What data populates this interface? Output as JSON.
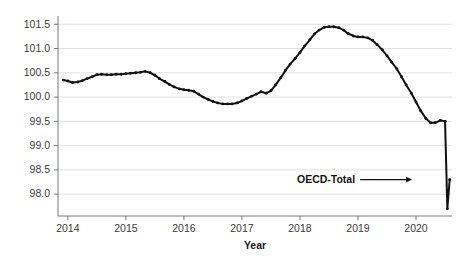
{
  "chart_data": {
    "type": "line",
    "title": "",
    "subtitle": "",
    "xlabel": "Year",
    "ylabel": "",
    "ylim": [
      97.55,
      101.65
    ],
    "xlim": [
      2013.83,
      2020.62
    ],
    "grid": true,
    "gridlines_horizontal": true,
    "gridlines_vertical": false,
    "legend_position": "inline-annotation",
    "y_ticks": [
      98.0,
      98.5,
      99.0,
      99.5,
      100.0,
      100.5,
      101.0,
      101.5
    ],
    "y_tick_labels": [
      "98.0",
      "98.5",
      "99.0",
      "99.5",
      "100.0",
      "100.5",
      "101.0",
      "101.5"
    ],
    "x_ticks": [
      2014,
      2015,
      2016,
      2017,
      2018,
      2019,
      2020
    ],
    "x_tick_labels": [
      "2014",
      "2015",
      "2016",
      "2017",
      "2018",
      "2019",
      "2020"
    ],
    "annotations": [
      {
        "text": "OECD-Total",
        "x": 2019.95,
        "y": 98.3,
        "leader": true,
        "arrow": true
      }
    ],
    "series": [
      {
        "name": "OECD-Total",
        "color": "#111111",
        "marker": "dot",
        "x": [
          2013.92,
          2014.0,
          2014.08,
          2014.17,
          2014.25,
          2014.33,
          2014.42,
          2014.5,
          2014.58,
          2014.67,
          2014.75,
          2014.83,
          2014.92,
          2015.0,
          2015.08,
          2015.17,
          2015.25,
          2015.33,
          2015.42,
          2015.5,
          2015.58,
          2015.67,
          2015.75,
          2015.83,
          2015.92,
          2016.0,
          2016.08,
          2016.17,
          2016.25,
          2016.33,
          2016.42,
          2016.5,
          2016.58,
          2016.67,
          2016.75,
          2016.83,
          2016.92,
          2017.0,
          2017.08,
          2017.17,
          2017.25,
          2017.33,
          2017.42,
          2017.5,
          2017.58,
          2017.67,
          2017.75,
          2017.83,
          2017.92,
          2018.0,
          2018.08,
          2018.17,
          2018.25,
          2018.33,
          2018.42,
          2018.5,
          2018.58,
          2018.67,
          2018.75,
          2018.83,
          2018.92,
          2019.0,
          2019.08,
          2019.17,
          2019.25,
          2019.33,
          2019.42,
          2019.5,
          2019.58,
          2019.67,
          2019.75,
          2019.83,
          2019.92,
          2020.0,
          2020.08,
          2020.17,
          2020.25,
          2020.33,
          2020.42,
          2020.5
        ],
        "y": [
          100.35,
          100.33,
          100.3,
          100.31,
          100.34,
          100.38,
          100.42,
          100.46,
          100.47,
          100.46,
          100.46,
          100.47,
          100.47,
          100.48,
          100.49,
          100.5,
          100.51,
          100.53,
          100.5,
          100.45,
          100.38,
          100.32,
          100.26,
          100.21,
          100.17,
          100.15,
          100.14,
          100.12,
          100.06,
          100.0,
          99.95,
          99.91,
          99.88,
          99.86,
          99.86,
          99.86,
          99.88,
          99.92,
          99.97,
          100.02,
          100.06,
          100.11,
          100.08,
          100.13,
          100.25,
          100.4,
          100.55,
          100.68,
          100.8,
          100.92,
          101.05,
          101.18,
          101.3,
          101.38,
          101.44,
          101.45,
          101.45,
          101.43,
          101.38,
          101.31,
          101.26,
          101.24,
          101.24,
          101.22,
          101.17,
          101.08,
          100.97,
          100.85,
          100.72,
          100.58,
          100.42,
          100.25,
          100.08,
          99.9,
          99.72,
          99.56,
          99.47,
          99.47,
          99.52,
          99.5
        ]
      },
      {
        "name": "OECD-Total-covid",
        "color": "#111111",
        "marker": "dot",
        "x": [
          2020.5,
          2020.54,
          2020.58
        ],
        "y": [
          99.5,
          97.7,
          98.3
        ]
      }
    ]
  }
}
